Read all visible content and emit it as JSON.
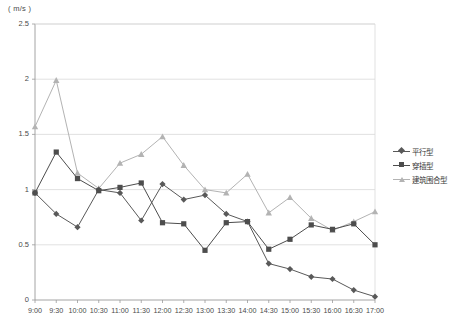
{
  "chart_data": {
    "type": "line",
    "title": "",
    "xlabel": "",
    "ylabel": "(m/s)",
    "unit_label": "( m/s )",
    "ylim": [
      0,
      2.5
    ],
    "yticks": [
      "0",
      "0.5",
      "1",
      "1.5",
      "2",
      "2.5"
    ],
    "ytick_values": [
      0,
      0.5,
      1,
      1.5,
      2,
      2.5
    ],
    "grid": true,
    "legend_position": "right",
    "categories": [
      "9:00",
      "9:30",
      "10:00",
      "10:30",
      "11:00",
      "11:30",
      "12:00",
      "12:30",
      "13:00",
      "13:30",
      "14:00",
      "14:30",
      "15:00",
      "15:30",
      "16:00",
      "16:30",
      "17:00"
    ],
    "series": [
      {
        "name": "平行型",
        "marker": "diamond",
        "color": "#595959",
        "values": [
          0.97,
          0.78,
          0.66,
          1.0,
          0.97,
          0.72,
          1.05,
          0.91,
          0.95,
          0.78,
          0.71,
          0.33,
          0.28,
          0.21,
          0.19,
          0.09,
          0.03
        ]
      },
      {
        "name": "穿插型",
        "marker": "square",
        "color": "#4d4d4d",
        "values": [
          0.97,
          1.34,
          1.1,
          0.99,
          1.02,
          1.06,
          0.7,
          0.69,
          0.45,
          0.7,
          0.71,
          0.46,
          0.55,
          0.68,
          0.64,
          0.69,
          0.5
        ]
      },
      {
        "name": "建筑围合型",
        "marker": "triangle",
        "color": "#b3b3b3",
        "values": [
          1.57,
          1.99,
          1.15,
          1.01,
          1.24,
          1.32,
          1.48,
          1.22,
          1.0,
          0.97,
          1.14,
          0.79,
          0.93,
          0.74,
          0.63,
          0.71,
          0.8
        ]
      }
    ]
  },
  "legend": {
    "items": [
      {
        "label": "平行型"
      },
      {
        "label": "穿插型"
      },
      {
        "label": "建筑围合型"
      }
    ]
  },
  "plot": {
    "left": 35,
    "right": 375,
    "top": 24,
    "bottom": 300
  }
}
